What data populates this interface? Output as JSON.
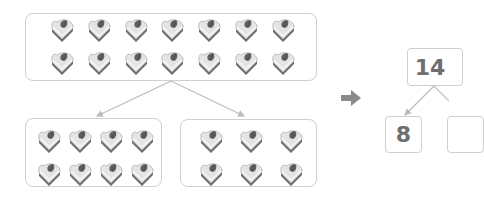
{
  "diagram": {
    "whole_group": {
      "count": 14,
      "rows": 2,
      "cols": 7,
      "icon": "cake-slice-icon"
    },
    "part_groups": [
      {
        "count": 8,
        "rows": 2,
        "cols": 4,
        "icon": "cake-slice-icon"
      },
      {
        "count": 6,
        "rows": 2,
        "cols": 3,
        "icon": "cake-slice-icon"
      }
    ],
    "transition_icon": "right-arrow-icon",
    "number_bond": {
      "whole": "14",
      "parts": [
        "8",
        ""
      ]
    },
    "colors": {
      "border": "#cfcfcf",
      "line": "#bdbdbd",
      "arrow": "#8a8a8a",
      "number_text": "#6f6f6f"
    }
  }
}
